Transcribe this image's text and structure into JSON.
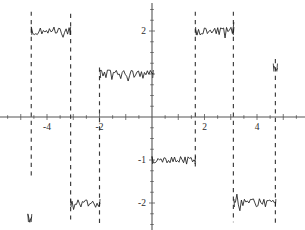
{
  "chart_data": {
    "type": "line",
    "title": "",
    "xlabel": "",
    "ylabel": "",
    "xlim": [
      -5.8,
      5.85
    ],
    "ylim": [
      -2.7,
      2.65
    ],
    "grid": false,
    "legend": null,
    "axes": {
      "x_axis_label_values": [
        -4,
        -2,
        2,
        4
      ],
      "x_axis_label_texts": [
        "-4",
        "-2",
        "2",
        "4"
      ],
      "y_axis_label_values": [
        2,
        -1,
        -2
      ],
      "y_axis_label_texts": [
        "2",
        "-1",
        "-2"
      ],
      "x_minor_tick_step": 0.5,
      "y_minor_tick_step": 0.25,
      "origin": [
        0,
        0
      ],
      "axis_color": "#555555"
    },
    "asymptotes": {
      "style": "dashed",
      "color": "#3a3a3a",
      "x_positions": [
        -4.6,
        -3.1,
        -2.0,
        1.65,
        3.1,
        4.7
      ]
    },
    "series": [
      {
        "name": "branch-1",
        "comment": "left partial branch below axis",
        "level": -2.35,
        "x_start": -4.73,
        "x_end": -4.58,
        "noise_amplitude": 0.1
      },
      {
        "name": "branch-2",
        "comment": "plateau at y=2 between x=-4.6 and x=-3.1",
        "level": 2.0,
        "x_start": -4.6,
        "x_end": -3.1,
        "noise_amplitude": 0.1
      },
      {
        "name": "branch-3",
        "comment": "plateau at y=-2 between x=-3.1 and x=-2.0",
        "level": -2.0,
        "x_start": -3.1,
        "x_end": -1.98,
        "noise_amplitude": 0.1
      },
      {
        "name": "branch-4",
        "comment": "plateau at y=1 between x=-2.0 and x=0",
        "level": 1.0,
        "x_start": -1.98,
        "x_end": 0.05,
        "noise_amplitude": 0.1
      },
      {
        "name": "branch-5",
        "comment": "plateau at y=-1 between x=0 and x=1.65",
        "level": -1.0,
        "x_start": 0.0,
        "x_end": 1.66,
        "noise_amplitude": 0.08
      },
      {
        "name": "branch-6",
        "comment": "plateau at y=2 between x=1.65 and x=3.1",
        "level": 2.0,
        "x_start": 1.66,
        "x_end": 3.12,
        "noise_amplitude": 0.1
      },
      {
        "name": "branch-7",
        "comment": "plateau at y=-2 between x=3.1 and x=4.7",
        "level": -2.0,
        "x_start": 3.12,
        "x_end": 4.72,
        "noise_amplitude": 0.1
      },
      {
        "name": "branch-8",
        "comment": "right partial branch above axis",
        "level": 1.15,
        "x_start": 4.62,
        "x_end": 4.78,
        "noise_amplitude": 0.1
      }
    ]
  }
}
